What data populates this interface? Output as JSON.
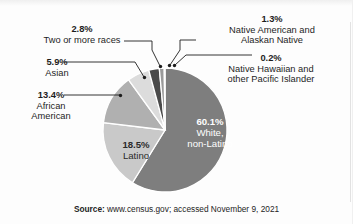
{
  "figure": {
    "background_color": "#fdfdfd",
    "source_lead": "Source:",
    "source_rest": " www.census.gov; accessed November 9, 2021"
  },
  "chart_data": {
    "type": "pie",
    "title": "",
    "subtitle": "",
    "xlabel": "",
    "ylabel": "",
    "legend_position": "none-callout-labels",
    "grid": false,
    "total": 102.2,
    "start_angle_deg": 0,
    "direction": "clockwise",
    "categories": [
      "White, non-Latino",
      "Latino",
      "African American",
      "Asian",
      "Two or more races",
      "Native American and Alaskan Native",
      "Native Hawaiian and other Pacific Islander"
    ],
    "values": [
      60.1,
      18.5,
      13.4,
      5.9,
      2.8,
      1.3,
      0.2
    ],
    "slices": [
      {
        "label": "White, non-Latino",
        "value": 60.1,
        "pct_text": "60.1%",
        "name_line1": "White,",
        "name_line2": "non-Latino",
        "color": "#7e7e7e",
        "label_placement": "inside",
        "text_color": "#ffffff"
      },
      {
        "label": "Latino",
        "value": 18.5,
        "pct_text": "18.5%",
        "name_line1": "Latino",
        "name_line2": "",
        "color": "#c9c9c9",
        "label_placement": "inside",
        "text_color": "#2a2a2a"
      },
      {
        "label": "African American",
        "value": 13.4,
        "pct_text": "13.4%",
        "name_line1": "African",
        "name_line2": "American",
        "color": "#b0b0b0",
        "label_placement": "callout-left",
        "text_color": "#1d1d1d"
      },
      {
        "label": "Asian",
        "value": 5.9,
        "pct_text": "5.9%",
        "name_line1": "Asian",
        "name_line2": "",
        "color": "#dcdcdc",
        "label_placement": "callout-left",
        "text_color": "#1d1d1d"
      },
      {
        "label": "Two or more races",
        "value": 2.8,
        "pct_text": "2.8%",
        "name_line1": "Two or more races",
        "name_line2": "",
        "color": "#4a4a4a",
        "label_placement": "callout-topleft",
        "text_color": "#1d1d1d"
      },
      {
        "label": "Native American and Alaskan Native",
        "value": 1.3,
        "pct_text": "1.3%",
        "name_line1": "Native American and",
        "name_line2": "Alaskan Native",
        "color": "#9a9a9a",
        "label_placement": "callout-topright",
        "text_color": "#1d1d1d"
      },
      {
        "label": "Native Hawaiian and other Pacific Islander",
        "value": 0.2,
        "pct_text": "0.2%",
        "name_line1": "Native Hawaiian and",
        "name_line2": "other Pacific Islander",
        "color": "#6f6f6f",
        "label_placement": "callout-right",
        "text_color": "#1d1d1d"
      }
    ]
  }
}
